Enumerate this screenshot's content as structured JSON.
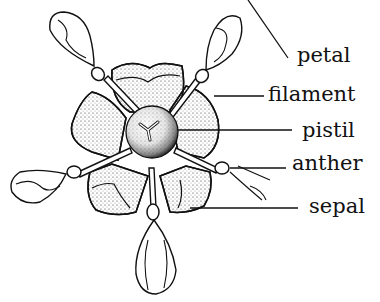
{
  "diagram": {
    "type": "flower anatomy illustration",
    "labels": [
      {
        "id": "petal",
        "text": "petal",
        "x": 301,
        "y": 40
      },
      {
        "id": "filament",
        "text": "filament",
        "x": 270,
        "y": 82
      },
      {
        "id": "pistil",
        "text": "pistil",
        "x": 302,
        "y": 122
      },
      {
        "id": "anther",
        "text": "anther",
        "x": 293,
        "y": 154
      },
      {
        "id": "sepal",
        "text": "sepal",
        "x": 310,
        "y": 196
      }
    ],
    "colors": {
      "ink": "#111111",
      "background": "#ffffff"
    }
  }
}
